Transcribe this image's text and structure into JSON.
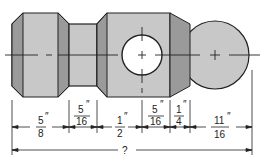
{
  "diagram": {
    "type": "engineering-drawing",
    "colors": {
      "body_fill": "#c8c8c8",
      "bevel_fill": "#9a9a9a",
      "outline": "#222222",
      "hole_fill": "#ffffff"
    },
    "dimensions": [
      {
        "num": "5",
        "den": "8",
        "unit": "″"
      },
      {
        "num": "5",
        "den": "16",
        "unit": "″"
      },
      {
        "num": "1",
        "den": "2",
        "unit": "″"
      },
      {
        "num": "5",
        "den": "16",
        "unit": "″"
      },
      {
        "num": "1",
        "den": "4",
        "unit": "″"
      },
      {
        "num": "11",
        "den": "16",
        "unit": "″"
      }
    ],
    "total_label": "?"
  }
}
